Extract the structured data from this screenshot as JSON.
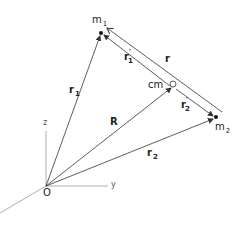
{
  "diagram": {
    "labels": {
      "m1": {
        "base": "m",
        "sub": "1"
      },
      "m2": {
        "base": "m",
        "sub": "2"
      },
      "r": "r",
      "r1": {
        "base": "r",
        "sub": "1"
      },
      "r2": {
        "base": "r",
        "sub": "2"
      },
      "r1_prime": {
        "base": "r",
        "prime": "′",
        "sub": "1"
      },
      "r2_prime": {
        "base": "r",
        "prime": "′",
        "sub": "2"
      },
      "R": "R",
      "cm": "cm",
      "origin": "O",
      "axis_z": "z",
      "axis_y": "y"
    },
    "colors": {
      "vector": "#333333",
      "axis": "#999999",
      "point": "#111111"
    },
    "points": {
      "O": [
        46,
        186
      ],
      "m1": [
        101,
        33
      ],
      "m2": [
        216,
        117
      ],
      "cm": [
        173,
        86
      ]
    }
  }
}
